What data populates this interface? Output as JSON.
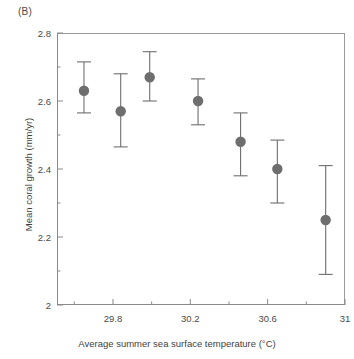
{
  "panel": {
    "label": "(B)"
  },
  "colors": {
    "marker": "#6e6e6e",
    "errorbar": "#6e6e6e",
    "axis": "#8a8a8a",
    "text": "#3f3f3f",
    "background": "#ffffff"
  },
  "chart_data": {
    "type": "scatter",
    "title": "",
    "subtitle": "",
    "xlabel": "Average summer sea surface temperature (°C)",
    "ylabel": "Mean coral growth (mm/yr)",
    "xlim": [
      29.5105,
      31.0
    ],
    "ylim": [
      2.0,
      2.8
    ],
    "grid": false,
    "legend": null,
    "xticks": [
      29.8,
      30.2,
      30.6,
      31
    ],
    "xtick_labels": [
      "29.8",
      "30.2",
      "30.6",
      "31"
    ],
    "xminor_ticks": [
      29.6,
      30.0,
      30.4,
      30.8
    ],
    "yticks": [
      2,
      2.2,
      2.4,
      2.6,
      2.8
    ],
    "ytick_labels": [
      "2",
      "2.2",
      "2.4",
      "2.6",
      "2.8"
    ],
    "yminor_ticks": [
      2.1,
      2.3,
      2.5,
      2.7
    ],
    "error_type": "error bars (95% CI)",
    "x": [
      29.65,
      29.84,
      29.99,
      30.24,
      30.46,
      30.65,
      30.9
    ],
    "y": [
      2.63,
      2.57,
      2.67,
      2.6,
      2.48,
      2.4,
      2.25
    ],
    "y_err_low": [
      2.565,
      2.465,
      2.6,
      2.53,
      2.38,
      2.3,
      2.09
    ],
    "y_err_high": [
      2.715,
      2.68,
      2.745,
      2.665,
      2.565,
      2.485,
      2.41
    ],
    "points": [
      {
        "x": 29.65,
        "y": 2.63,
        "lo": 2.565,
        "hi": 2.715
      },
      {
        "x": 29.84,
        "y": 2.57,
        "lo": 2.465,
        "hi": 2.68
      },
      {
        "x": 29.99,
        "y": 2.67,
        "lo": 2.6,
        "hi": 2.745
      },
      {
        "x": 30.24,
        "y": 2.6,
        "lo": 2.53,
        "hi": 2.665
      },
      {
        "x": 30.46,
        "y": 2.48,
        "lo": 2.38,
        "hi": 2.565
      },
      {
        "x": 30.65,
        "y": 2.4,
        "lo": 2.3,
        "hi": 2.485
      },
      {
        "x": 30.9,
        "y": 2.25,
        "lo": 2.09,
        "hi": 2.41
      }
    ]
  }
}
